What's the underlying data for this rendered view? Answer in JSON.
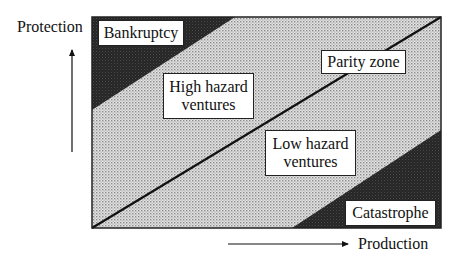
{
  "diagram": {
    "axes": {
      "y_label": "Protection",
      "x_label": "Production"
    },
    "regions": {
      "bankruptcy": {
        "label": "Bankruptcy"
      },
      "high_hazard": {
        "line1": "High hazard",
        "line2": "ventures"
      },
      "parity": {
        "label": "Parity zone"
      },
      "low_hazard": {
        "line1": "Low hazard",
        "line2": "ventures"
      },
      "catastrophe": {
        "label": "Catastrophe"
      }
    },
    "colors": {
      "frame": "#222222",
      "dark_region": "#2a2a2a",
      "light_region": "#cfcfcf",
      "parity_line": "#111111"
    }
  }
}
